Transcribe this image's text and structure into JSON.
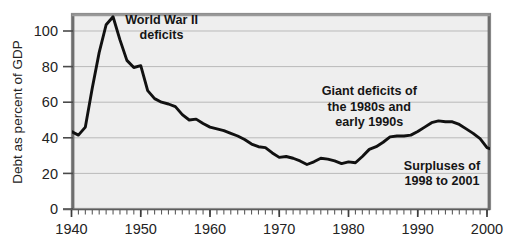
{
  "chart_data": {
    "type": "line",
    "title": "",
    "xlabel": "",
    "ylabel": "Debt as percent of GDP",
    "xlim": [
      1940,
      2001
    ],
    "ylim": [
      0,
      110
    ],
    "xticks": [
      1940,
      1950,
      1960,
      1970,
      1980,
      1990,
      2000
    ],
    "xtick_labels": [
      "1940",
      "1950",
      "1960",
      "1970",
      "1980",
      "1990",
      "2000"
    ],
    "yticks": [
      0,
      20,
      40,
      60,
      80,
      100
    ],
    "ytick_labels": [
      "0",
      "20",
      "40",
      "60",
      "80",
      "100"
    ],
    "minor_xtick_interval": 1,
    "grid": "horizontal",
    "legend": "none",
    "series": [
      {
        "name": "Federal debt held by the public as percent of GDP",
        "color": "#111111",
        "x": [
          1940,
          1941,
          1942,
          1943,
          1944,
          1945,
          1946,
          1947,
          1948,
          1949,
          1950,
          1951,
          1952,
          1953,
          1954,
          1955,
          1956,
          1957,
          1958,
          1959,
          1960,
          1961,
          1962,
          1963,
          1964,
          1965,
          1966,
          1967,
          1968,
          1969,
          1970,
          1971,
          1972,
          1973,
          1974,
          1975,
          1976,
          1977,
          1978,
          1979,
          1980,
          1981,
          1982,
          1983,
          1984,
          1985,
          1986,
          1987,
          1988,
          1989,
          1990,
          1991,
          1992,
          1993,
          1994,
          1995,
          1996,
          1997,
          1998,
          1999,
          2000,
          2001
        ],
        "y": [
          43.5,
          41.5,
          46.0,
          68.0,
          88.0,
          103.5,
          108.0,
          95.0,
          83.5,
          79.5,
          80.5,
          66.5,
          62.0,
          60.0,
          59.0,
          57.5,
          53.0,
          50.0,
          50.5,
          48.0,
          46.0,
          45.0,
          44.0,
          42.5,
          41.0,
          39.0,
          36.5,
          35.0,
          34.5,
          31.5,
          29.0,
          29.5,
          28.5,
          27.0,
          25.0,
          26.5,
          28.5,
          28.0,
          27.0,
          25.5,
          26.5,
          26.0,
          29.5,
          33.5,
          35.0,
          37.5,
          40.5,
          41.0,
          41.0,
          41.5,
          43.5,
          46.0,
          48.5,
          49.5,
          49.0,
          49.0,
          47.5,
          45.0,
          42.5,
          39.5,
          34.5,
          33.0
        ],
        "annotated_points": [
          {
            "year": 1946,
            "value": 108.0,
            "note": "World War II peak"
          },
          {
            "year": 1974,
            "value": 25.0,
            "note": "post-war low"
          },
          {
            "year": 1993,
            "value": 49.5,
            "note": "1990s peak"
          },
          {
            "year": 2001,
            "value": 33.0,
            "note": "after surpluses"
          }
        ]
      }
    ],
    "annotations": [
      {
        "id": "ww2",
        "lines": [
          "World War II",
          "deficits"
        ],
        "x_data": 1953,
        "y_data": 104,
        "align": "center"
      },
      {
        "id": "giant-deficits",
        "lines": [
          "Giant deficits of",
          "the 1980s and",
          "early 1990s"
        ],
        "x_data": 1983,
        "y_data": 64,
        "align": "center"
      },
      {
        "id": "surpluses",
        "lines": [
          "Surpluses of",
          "1998 to 2001"
        ],
        "x_data": 1993.5,
        "y_data": 22,
        "align": "center"
      }
    ],
    "colors": {
      "plot_background": "#eeeeee",
      "page_background": "#ffffff",
      "grid_line": "#b9b9b9",
      "frame": "#7a7a7a",
      "line": "#111111",
      "text": "#1a1a1a"
    }
  }
}
